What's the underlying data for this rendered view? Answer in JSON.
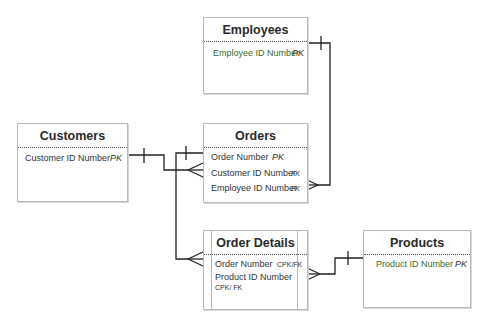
{
  "diagram": {
    "type": "entity-relationship",
    "entities": [
      {
        "name": "Employees",
        "attributes": [
          {
            "label": "Employee ID Number",
            "key": "PK"
          }
        ]
      },
      {
        "name": "Customers",
        "attributes": [
          {
            "label": "Customer ID Number",
            "key": "PK"
          }
        ]
      },
      {
        "name": "Orders",
        "attributes": [
          {
            "label": "Order Number",
            "key": "PK"
          },
          {
            "label": "Customer ID Number",
            "key": "FK"
          },
          {
            "label": "Employee ID Number",
            "key": "FK"
          }
        ]
      },
      {
        "name": "Order Details",
        "attributes": [
          {
            "label": "Order Number",
            "key": "CPK/FK"
          },
          {
            "label": "Product ID Number",
            "key": "CPK/ FK"
          }
        ]
      },
      {
        "name": "Products",
        "attributes": [
          {
            "label": "Product ID Number",
            "key": "PK"
          }
        ]
      }
    ],
    "relationships": [
      {
        "from": "Employees",
        "to": "Orders",
        "from_cardinality": "one",
        "to_cardinality": "many"
      },
      {
        "from": "Customers",
        "to": "Orders",
        "from_cardinality": "one",
        "to_cardinality": "many"
      },
      {
        "from": "Orders",
        "to": "Order Details",
        "from_cardinality": "one",
        "to_cardinality": "many"
      },
      {
        "from": "Products",
        "to": "Order Details",
        "from_cardinality": "one",
        "to_cardinality": "many"
      }
    ]
  },
  "colors": {
    "line": "#222222",
    "border": "#b9b9b9",
    "green_text": "#3a6b2a"
  }
}
